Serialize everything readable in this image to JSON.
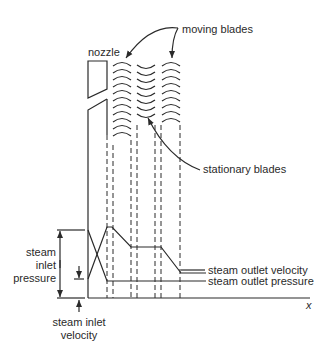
{
  "diagram": {
    "labels": {
      "nozzle": "nozzle",
      "moving_blades": "moving blades",
      "stationary_blades": "stationary blades",
      "steam_inlet_pressure": [
        "steam",
        "inlet",
        "pressure"
      ],
      "steam_inlet_velocity": [
        "steam inlet",
        "velocity"
      ],
      "steam_outlet_velocity": "steam outlet velocity",
      "steam_outlet_pressure": "steam outlet pressure",
      "x_axis": "x"
    },
    "stages": [
      "nozzle",
      "moving blades",
      "stationary blades",
      "moving blades"
    ],
    "blade_rows": [
      {
        "type": "moving",
        "count": 11
      },
      {
        "type": "stationary",
        "count": 8
      },
      {
        "type": "moving",
        "count": 9
      }
    ],
    "curves": {
      "velocity": "rises through nozzle, falls across each moving blade row, constant through stationary blades",
      "pressure": "falls through nozzle, constant thereafter"
    }
  }
}
